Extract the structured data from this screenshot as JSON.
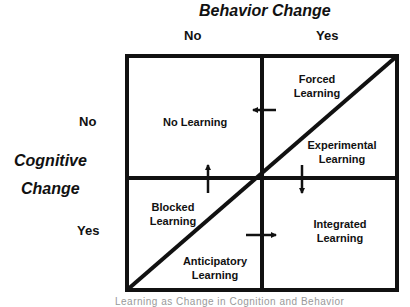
{
  "diagram": {
    "column_axis": {
      "title": "Behavior Change",
      "labels": [
        "No",
        "Yes"
      ]
    },
    "row_axis": {
      "title_line1": "Cognitive",
      "title_line2": "Change",
      "labels": [
        "No",
        "Yes"
      ]
    },
    "regions": {
      "top_left": "No Learning",
      "top_right_upper_line1": "Forced",
      "top_right_upper_line2": "Learning",
      "top_right_lower_line1": "Experimental",
      "top_right_lower_line2": "Learning",
      "bottom_left_upper_line1": "Blocked",
      "bottom_left_upper_line2": "Learning",
      "bottom_left_lower_line1": "Anticipatory",
      "bottom_left_lower_line2": "Learning",
      "bottom_right_line1": "Integrated",
      "bottom_right_line2": "Learning"
    },
    "arrows": [
      {
        "id": "forced-to-no",
        "direction": "left"
      },
      {
        "id": "blocked-to-no",
        "direction": "up"
      },
      {
        "id": "experimental-to-integrated",
        "direction": "down"
      },
      {
        "id": "anticipatory-to-integrated",
        "direction": "right"
      }
    ],
    "caption": "Learning as Change in Cognition and Behavior"
  }
}
